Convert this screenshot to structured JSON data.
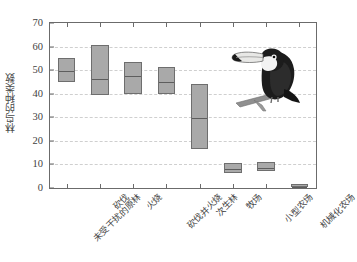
{
  "chart_data": {
    "type": "bar",
    "subtype": "floating-range-bar",
    "title": "",
    "xlabel": "",
    "ylabel": "林鸟的种类数",
    "ylim": [
      0,
      70
    ],
    "yticks": [
      0,
      10,
      20,
      30,
      40,
      50,
      60,
      70
    ],
    "ytick_labels": [
      "0",
      "10",
      "20",
      "30",
      "40",
      "50",
      "60",
      "70"
    ],
    "grid": true,
    "grid_axis": "y",
    "legend": "none",
    "categories": [
      "未受干扰的原林",
      "砍伐",
      "火烧",
      "砍伐并火烧",
      "次生林",
      "牧场",
      "小型农场",
      "机械化农场"
    ],
    "series": [
      {
        "name": "下限",
        "values": [
          45,
          39.5,
          40,
          40,
          16.5,
          6.5,
          7,
          0.5
        ]
      },
      {
        "name": "中值",
        "values": [
          50,
          46.5,
          48,
          45.5,
          30,
          8.5,
          9,
          1
        ]
      },
      {
        "name": "上限",
        "values": [
          55,
          60.5,
          53.5,
          51.5,
          44,
          10.5,
          11,
          1.5
        ]
      }
    ],
    "annotations": [
      {
        "name": "toucan-illustration",
        "description": "巨嘴鸟插图",
        "x": 6.2,
        "y": 58
      }
    ],
    "colors": {
      "box_fill": "#a9a9a9",
      "box_stroke": "#6e6e6e",
      "median_line": "#5d5d5d",
      "gridline": "#cfcfcf",
      "axis": "#6b6b6b",
      "text": "#3f3f3f"
    }
  }
}
